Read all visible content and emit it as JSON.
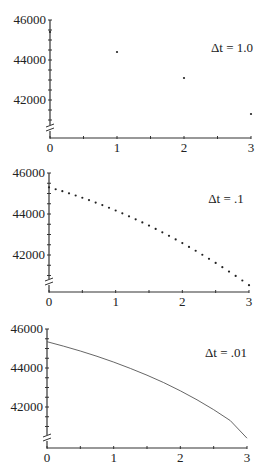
{
  "chart_data": [
    {
      "type": "scatter",
      "title": "Δt = 1.0",
      "annotation": "Δt = 1.0",
      "xlabel": "",
      "ylabel": "",
      "xlim": [
        0,
        3
      ],
      "ylim": [
        40000,
        46000
      ],
      "x_ticks": [
        "0",
        "1",
        "2",
        "3"
      ],
      "y_ticks": [
        "46000",
        "44000",
        "42000"
      ],
      "axis_break": true,
      "x": [
        0,
        1,
        2,
        3
      ],
      "values": [
        45400,
        44400,
        43100,
        41300
      ]
    },
    {
      "type": "scatter",
      "title": "Δt = .1",
      "annotation": "Δt = .1",
      "xlabel": "",
      "ylabel": "",
      "xlim": [
        0,
        3
      ],
      "ylim": [
        40000,
        46000
      ],
      "x_ticks": [
        "0",
        "1",
        "2",
        "3"
      ],
      "y_ticks": [
        "46000",
        "44000",
        "42000"
      ],
      "axis_break": true,
      "x": [
        0,
        0.1,
        0.2,
        0.3,
        0.4,
        0.5,
        0.6,
        0.7,
        0.8,
        0.9,
        1.0,
        1.1,
        1.2,
        1.3,
        1.4,
        1.5,
        1.6,
        1.7,
        1.8,
        1.9,
        2.0,
        2.1,
        2.2,
        2.3,
        2.4,
        2.5,
        2.6,
        2.7,
        2.8,
        2.9,
        3.0
      ],
      "values": [
        45300,
        45208,
        45111,
        45009,
        44903,
        44793,
        44677,
        44557,
        44433,
        44304,
        44170,
        44032,
        43889,
        43742,
        43589,
        43433,
        43271,
        43105,
        42935,
        42760,
        42580,
        42396,
        42207,
        42013,
        41815,
        41613,
        41405,
        41193,
        40977,
        40756,
        40530
      ]
    },
    {
      "type": "line",
      "title": "Δt = .01",
      "annotation": "Δt = .01",
      "xlabel": "",
      "ylabel": "",
      "xlim": [
        0,
        3
      ],
      "ylim": [
        40000,
        46000
      ],
      "x_ticks": [
        "0",
        "1",
        "2",
        "3"
      ],
      "y_ticks": [
        "46000",
        "44000",
        "42000"
      ],
      "axis_break": true,
      "x": [
        0,
        0.25,
        0.5,
        0.75,
        1.0,
        1.25,
        1.5,
        1.75,
        2.0,
        2.25,
        2.5,
        2.75,
        3.0
      ],
      "values": [
        45350,
        45120,
        44870,
        44600,
        44300,
        43980,
        43630,
        43250,
        42830,
        42370,
        41860,
        41300,
        40400
      ]
    }
  ]
}
